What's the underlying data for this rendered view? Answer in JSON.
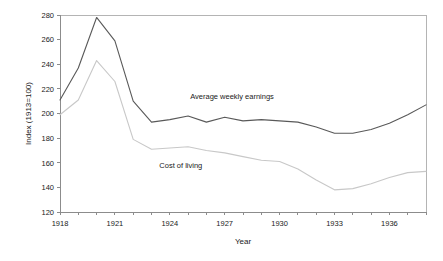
{
  "chart_data": {
    "type": "line",
    "title": "",
    "xlabel": "Year",
    "ylabel": "Index (1913=100)",
    "xlim": [
      1918,
      1938
    ],
    "ylim": [
      120,
      280
    ],
    "grid": false,
    "legend_position": "inline-annotations",
    "x": [
      1918,
      1919,
      1920,
      1921,
      1922,
      1923,
      1924,
      1925,
      1926,
      1927,
      1928,
      1929,
      1930,
      1931,
      1932,
      1933,
      1934,
      1935,
      1936,
      1937,
      1938
    ],
    "x_tick_labels": [
      "1918",
      "1921",
      "1924",
      "1927",
      "1930",
      "1933",
      "1936"
    ],
    "x_tick_values": [
      1918,
      1921,
      1924,
      1927,
      1930,
      1933,
      1936
    ],
    "y_tick_labels": [
      "120",
      "140",
      "160",
      "180",
      "200",
      "220",
      "240",
      "260",
      "280"
    ],
    "y_tick_values": [
      120,
      140,
      160,
      180,
      200,
      220,
      240,
      260,
      280
    ],
    "series": [
      {
        "name": "Average weekly earnings",
        "color": "#595959",
        "label_x": 1927.4,
        "label_y": 212,
        "values": [
          211,
          237,
          278,
          259,
          210,
          193,
          195,
          198,
          193,
          197,
          194,
          195,
          194,
          193,
          189,
          184,
          184,
          187,
          192,
          199,
          207
        ]
      },
      {
        "name": "Cost of living",
        "color": "#c8c8c8",
        "label_x": 1924.6,
        "label_y": 156,
        "values": [
          199,
          211,
          243,
          226,
          179,
          171,
          172,
          173,
          170,
          168,
          165,
          162,
          161,
          155,
          146,
          138,
          139,
          143,
          148,
          152,
          153
        ]
      }
    ],
    "annotations": [
      {
        "text": "Average weekly earnings",
        "series": "Average weekly earnings"
      },
      {
        "text": "Cost of living",
        "series": "Cost of living"
      }
    ]
  }
}
